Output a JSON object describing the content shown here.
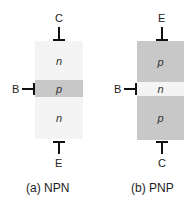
{
  "colors": {
    "n_region": "#f4f4f4",
    "p_region": "#c8c8c8",
    "lead": "#111111"
  },
  "npn": {
    "caption": "(a) NPN",
    "top_terminal": "C",
    "base_terminal": "B",
    "bottom_terminal": "E",
    "regions": [
      {
        "label": "n",
        "type": "n"
      },
      {
        "label": "p",
        "type": "p"
      },
      {
        "label": "n",
        "type": "n"
      }
    ]
  },
  "pnp": {
    "caption": "(b) PNP",
    "top_terminal": "E",
    "base_terminal": "B",
    "bottom_terminal": "C",
    "regions": [
      {
        "label": "p",
        "type": "p"
      },
      {
        "label": "n",
        "type": "n"
      },
      {
        "label": "p",
        "type": "p"
      }
    ]
  }
}
